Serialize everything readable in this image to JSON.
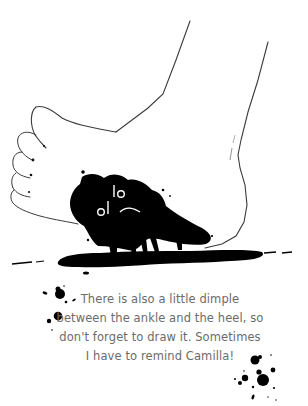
{
  "illustration": {
    "subject": "foot-drawing-with-ink-splatter",
    "line_color": "#3a3a3a",
    "ink_color": "#000000",
    "background_color": "#ffffff"
  },
  "caption": {
    "lines": [
      "There is also a little dimple",
      "between the ankle and the heel, so",
      "don't forget to draw it. Sometimes",
      "I have to remind Camilla!"
    ],
    "text_color": "#6b6b6b"
  }
}
